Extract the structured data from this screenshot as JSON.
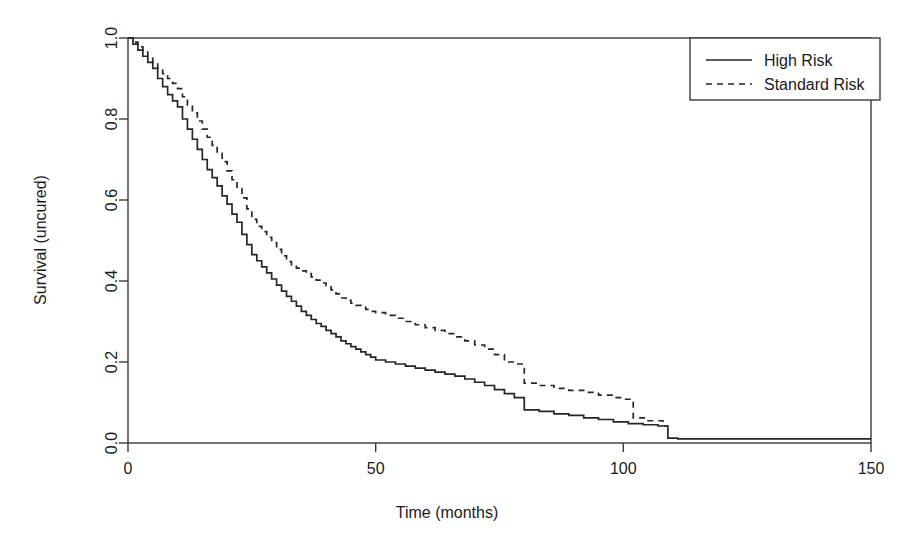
{
  "chart_data": {
    "type": "line",
    "title": "",
    "subtitle": "",
    "xlabel": "Time (months)",
    "ylabel": "Survival (uncured)",
    "xlim": [
      0,
      150
    ],
    "ylim": [
      0.0,
      1.0
    ],
    "xticks": [
      0,
      50,
      100,
      150
    ],
    "xtick_labels": [
      "0",
      "50",
      "100",
      "150"
    ],
    "yticks": [
      0.0,
      0.2,
      0.4,
      0.6,
      0.8,
      1.0
    ],
    "ytick_labels": [
      "0.0",
      "0.2",
      "0.4",
      "0.6",
      "0.8",
      "1.0"
    ],
    "grid": false,
    "legend_position": "top-right",
    "step_type": "post",
    "series": [
      {
        "name": "High Risk",
        "style": "solid",
        "color": "#262626",
        "x": [
          0,
          1,
          2,
          3,
          4,
          5,
          6,
          7,
          8,
          9,
          10,
          11,
          12,
          13,
          14,
          15,
          16,
          17,
          18,
          19,
          20,
          21,
          22,
          23,
          24,
          25,
          26,
          27,
          28,
          29,
          30,
          31,
          32,
          33,
          34,
          35,
          36,
          37,
          38,
          39,
          40,
          41,
          42,
          43,
          44,
          45,
          46,
          47,
          48,
          49,
          50,
          52,
          54,
          56,
          58,
          60,
          62,
          64,
          66,
          68,
          70,
          72,
          74,
          76,
          78,
          80,
          83,
          86,
          89,
          92,
          95,
          98,
          101,
          104,
          107,
          109,
          111,
          150
        ],
        "y": [
          1.0,
          0.985,
          0.97,
          0.955,
          0.94,
          0.925,
          0.9,
          0.88,
          0.86,
          0.845,
          0.83,
          0.8,
          0.775,
          0.75,
          0.725,
          0.7,
          0.675,
          0.655,
          0.635,
          0.61,
          0.59,
          0.565,
          0.545,
          0.515,
          0.49,
          0.465,
          0.45,
          0.435,
          0.42,
          0.405,
          0.39,
          0.375,
          0.362,
          0.35,
          0.338,
          0.325,
          0.315,
          0.305,
          0.295,
          0.288,
          0.278,
          0.27,
          0.262,
          0.252,
          0.245,
          0.238,
          0.232,
          0.225,
          0.218,
          0.212,
          0.205,
          0.2,
          0.195,
          0.19,
          0.185,
          0.18,
          0.175,
          0.17,
          0.165,
          0.158,
          0.15,
          0.142,
          0.132,
          0.122,
          0.112,
          0.082,
          0.078,
          0.072,
          0.068,
          0.062,
          0.058,
          0.052,
          0.048,
          0.045,
          0.042,
          0.012,
          0.01,
          0.01
        ]
      },
      {
        "name": "Standard Risk",
        "style": "dashed",
        "color": "#262626",
        "x": [
          0,
          1,
          2,
          3,
          4,
          5,
          6,
          7,
          8,
          9,
          10,
          11,
          12,
          13,
          14,
          15,
          16,
          17,
          18,
          19,
          20,
          21,
          22,
          23,
          24,
          25,
          26,
          27,
          28,
          29,
          30,
          31,
          32,
          33,
          34,
          35,
          36,
          37,
          38,
          39,
          40,
          41,
          42,
          43,
          44,
          45,
          46,
          47,
          48,
          49,
          50,
          52,
          54,
          56,
          58,
          60,
          62,
          64,
          66,
          68,
          70,
          72,
          74,
          76,
          78,
          80,
          83,
          86,
          89,
          92,
          95,
          98,
          100,
          102,
          105,
          108,
          109
        ],
        "y": [
          1.0,
          0.99,
          0.978,
          0.965,
          0.95,
          0.94,
          0.925,
          0.912,
          0.9,
          0.888,
          0.875,
          0.855,
          0.835,
          0.815,
          0.795,
          0.775,
          0.755,
          0.735,
          0.715,
          0.695,
          0.672,
          0.65,
          0.628,
          0.605,
          0.578,
          0.552,
          0.535,
          0.522,
          0.508,
          0.495,
          0.478,
          0.462,
          0.448,
          0.44,
          0.432,
          0.425,
          0.418,
          0.41,
          0.402,
          0.395,
          0.388,
          0.378,
          0.368,
          0.358,
          0.352,
          0.345,
          0.34,
          0.335,
          0.33,
          0.325,
          0.322,
          0.315,
          0.308,
          0.3,
          0.292,
          0.285,
          0.278,
          0.27,
          0.262,
          0.252,
          0.242,
          0.232,
          0.218,
          0.2,
          0.195,
          0.148,
          0.142,
          0.135,
          0.13,
          0.125,
          0.118,
          0.112,
          0.108,
          0.062,
          0.055,
          0.042,
          0.042
        ]
      }
    ]
  },
  "legend": {
    "entries": [
      {
        "label": "High Risk",
        "style": "solid"
      },
      {
        "label": "Standard Risk",
        "style": "dashed"
      }
    ]
  }
}
